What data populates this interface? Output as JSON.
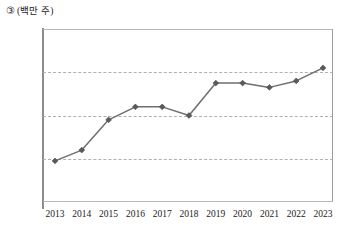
{
  "header": {
    "marker": "③",
    "unit": "(백만 주)"
  },
  "chart_data": {
    "type": "line",
    "title": "",
    "subtitle": "",
    "xlabel": "",
    "ylabel": "(백만 주)",
    "categories": [
      "2013",
      "2014",
      "2015",
      "2016",
      "2017",
      "2018",
      "2019",
      "2020",
      "2021",
      "2022",
      "2023"
    ],
    "values": [
      9.5,
      12,
      19,
      22,
      22,
      20,
      27.5,
      27.5,
      26.5,
      28,
      31
    ],
    "series": [
      {
        "name": "거래량",
        "values": [
          9.5,
          12,
          19,
          22,
          22,
          20,
          27.5,
          27.5,
          26.5,
          28,
          31
        ]
      }
    ],
    "ylim": [
      0,
      40
    ],
    "yticks": [
      10,
      20,
      30,
      40
    ],
    "ytick_labels": [
      "10",
      "20",
      "30",
      "40"
    ],
    "gridlines": [
      10,
      20,
      30
    ],
    "grid": true,
    "legend": "none",
    "marker_shape": "diamond",
    "line_color": "#6e6e6e",
    "marker_color": "#5a5a5a",
    "grid_color": "#b0b0b0",
    "axis_color": "#8c8c8c"
  }
}
